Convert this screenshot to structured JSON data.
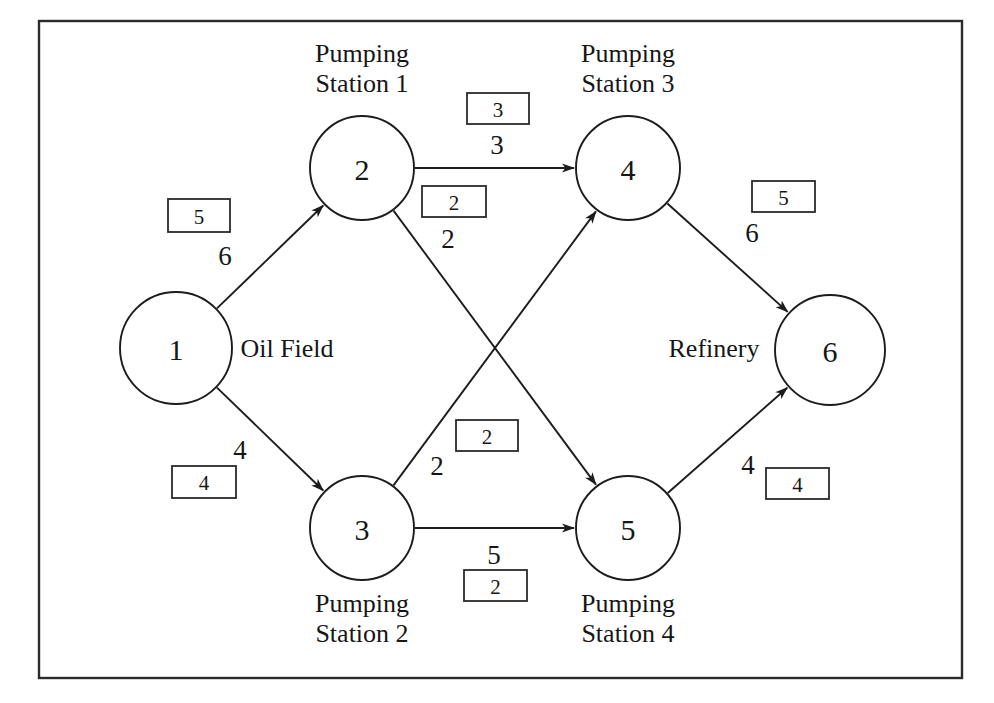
{
  "figure": {
    "border_color": "#2b2b2b",
    "line_color": "#1c1c1c",
    "background": "#ffffff"
  },
  "nodes": [
    {
      "id": "1",
      "label": "1",
      "name": "Oil Field",
      "cx": 176,
      "cy": 348,
      "r": 56
    },
    {
      "id": "2",
      "label": "2",
      "name": "Pumping Station 1",
      "cx": 362,
      "cy": 168,
      "r": 52
    },
    {
      "id": "3",
      "label": "3",
      "name": "Pumping Station 2",
      "cx": 362,
      "cy": 528,
      "r": 52
    },
    {
      "id": "4",
      "label": "4",
      "name": "Pumping Station 3",
      "cx": 628,
      "cy": 168,
      "r": 52
    },
    {
      "id": "5",
      "label": "5",
      "name": "Pumping Station 4",
      "cx": 628,
      "cy": 528,
      "r": 52
    },
    {
      "id": "6",
      "label": "6",
      "name": "Refinery",
      "cx": 830,
      "cy": 350,
      "r": 55
    }
  ],
  "node_side_labels": [
    {
      "node": "1",
      "text": "Oil Field",
      "x": 287,
      "y": 348
    },
    {
      "node": "6",
      "text": "Refinery",
      "x": 714,
      "y": 348
    }
  ],
  "station_captions": [
    {
      "node": "2",
      "line1": "Pumping",
      "line2": "Station 1",
      "x": 362,
      "y": 62,
      "position": "above"
    },
    {
      "node": "4",
      "line1": "Pumping",
      "line2": "Station 3",
      "x": 628,
      "y": 62,
      "position": "above"
    },
    {
      "node": "3",
      "line1": "Pumping",
      "line2": "Station 2",
      "x": 362,
      "y": 612,
      "position": "below"
    },
    {
      "node": "5",
      "line1": "Pumping",
      "line2": "Station 4",
      "x": 628,
      "y": 612,
      "position": "below"
    }
  ],
  "edges": [
    {
      "id": "e1-2",
      "from": "1",
      "to": "2",
      "cost": "6",
      "capacity": "5",
      "cost_pos": {
        "x": 225,
        "y": 256
      },
      "box_pos": {
        "x": 168,
        "y": 199,
        "w": 62,
        "h": 33
      }
    },
    {
      "id": "e1-3",
      "from": "1",
      "to": "3",
      "cost": "4",
      "capacity": "4",
      "cost_pos": {
        "x": 240,
        "y": 450
      },
      "box_pos": {
        "x": 172,
        "y": 466,
        "w": 64,
        "h": 32
      }
    },
    {
      "id": "e2-4",
      "from": "2",
      "to": "4",
      "cost": "3",
      "capacity": "3",
      "cost_pos": {
        "x": 497,
        "y": 145
      },
      "box_pos": {
        "x": 467,
        "y": 93,
        "w": 62,
        "h": 31
      }
    },
    {
      "id": "e2-5",
      "from": "2",
      "to": "5",
      "cost": "2",
      "capacity": "2",
      "cost_pos": {
        "x": 448,
        "y": 239
      },
      "box_pos": {
        "x": 422,
        "y": 186,
        "w": 64,
        "h": 31
      }
    },
    {
      "id": "e3-4",
      "from": "3",
      "to": "4",
      "cost": "2",
      "capacity": "2",
      "cost_pos": {
        "x": 437,
        "y": 466
      },
      "box_pos": {
        "x": 456,
        "y": 420,
        "w": 62,
        "h": 31
      }
    },
    {
      "id": "e3-5",
      "from": "3",
      "to": "5",
      "cost": "5",
      "capacity": "2",
      "cost_pos": {
        "x": 494,
        "y": 555
      },
      "box_pos": {
        "x": 464,
        "y": 570,
        "w": 63,
        "h": 31
      }
    },
    {
      "id": "e4-6",
      "from": "4",
      "to": "6",
      "cost": "6",
      "capacity": "5",
      "cost_pos": {
        "x": 752,
        "y": 233
      },
      "box_pos": {
        "x": 752,
        "y": 181,
        "w": 63,
        "h": 31
      }
    },
    {
      "id": "e5-6",
      "from": "5",
      "to": "6",
      "cost": "4",
      "capacity": "4",
      "cost_pos": {
        "x": 748,
        "y": 465
      },
      "box_pos": {
        "x": 766,
        "y": 468,
        "w": 63,
        "h": 31
      }
    }
  ],
  "frame": {
    "x": 39,
    "y": 21,
    "width": 923,
    "height": 657
  },
  "chart_data": {
    "type": "diagram",
    "graph_type": "directed network flow",
    "nodes": [
      "1",
      "2",
      "3",
      "4",
      "5",
      "6"
    ],
    "node_names": {
      "1": "Oil Field",
      "2": "Pumping Station 1",
      "3": "Pumping Station 2",
      "4": "Pumping Station 3",
      "5": "Pumping Station 4",
      "6": "Refinery"
    },
    "arcs": [
      {
        "from": "1",
        "to": "2",
        "cost": 6,
        "capacity": 5
      },
      {
        "from": "1",
        "to": "3",
        "cost": 4,
        "capacity": 4
      },
      {
        "from": "2",
        "to": "4",
        "cost": 3,
        "capacity": 3
      },
      {
        "from": "2",
        "to": "5",
        "cost": 2,
        "capacity": 2
      },
      {
        "from": "3",
        "to": "4",
        "cost": 2,
        "capacity": 2
      },
      {
        "from": "3",
        "to": "5",
        "cost": 5,
        "capacity": 2
      },
      {
        "from": "4",
        "to": "6",
        "cost": 6,
        "capacity": 5
      },
      {
        "from": "5",
        "to": "6",
        "cost": 4,
        "capacity": 4
      }
    ],
    "annotation": "Plain numbers beside arcs are unit costs; boxed numbers are arc capacities."
  }
}
